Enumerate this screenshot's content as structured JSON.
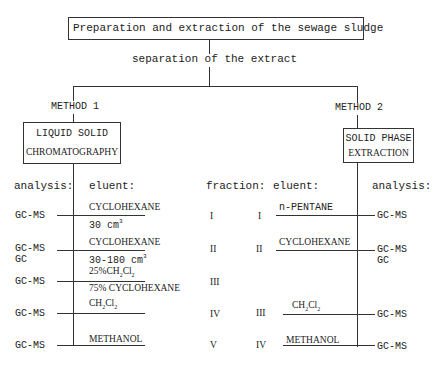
{
  "top": {
    "title": "Preparation and extraction of the sewage sludge",
    "step": "separation of the extract"
  },
  "methods": [
    {
      "label": "METHOD 1",
      "box_line1": "LIQUID SOLID",
      "box_line2": "CHROMATOGRAPHY"
    },
    {
      "label": "METHOD 2",
      "box_line1": "SOLID PHASE",
      "box_line2": "EXTRACTION"
    }
  ],
  "headers": {
    "analysis_left": "analysis:",
    "eluent_left": "eluent:",
    "fraction": "fraction:",
    "eluent_right": "eluent:",
    "analysis_right": "analysis:"
  },
  "method1_rows": [
    {
      "analysis": "GC-MS",
      "analysis2": "",
      "eluent": "CYCLOHEXANE",
      "eluent_detail": "30 cm",
      "detail_sup": "3",
      "fraction": "I"
    },
    {
      "analysis": "GC-MS",
      "analysis2": "GC",
      "eluent": "CYCLOHEXANE",
      "eluent_detail": "30-180 cm",
      "detail_sup": "3",
      "fraction": "II"
    },
    {
      "analysis": "GC-MS",
      "analysis2": "",
      "eluent_top": "25%CH",
      "eluent_sub1": "2",
      "eluent_mid": "Cl",
      "eluent_sub2": "2",
      "eluent": "75% CYCLOHEXANE",
      "fraction": "III"
    },
    {
      "analysis": "GC-MS",
      "analysis2": "",
      "eluent_a": "CH",
      "eluent_sub1": "2",
      "eluent_b": "Cl",
      "eluent_sub2": "2",
      "fraction": "IV"
    },
    {
      "analysis": "GC-MS",
      "analysis2": "",
      "eluent": "METHANOL",
      "fraction": "V"
    }
  ],
  "method2_rows": [
    {
      "fraction": "I",
      "eluent": "n-PENTANE",
      "analysis": "GC-MS",
      "analysis2": ""
    },
    {
      "fraction": "II",
      "eluent": "CYCLOHEXANE",
      "analysis": "GC-MS",
      "analysis2": "GC"
    },
    {
      "fraction": "III",
      "eluent_a": "CH",
      "eluent_sub1": "2",
      "eluent_b": "Cl",
      "eluent_sub2": "2",
      "analysis": "GC-MS",
      "analysis2": ""
    },
    {
      "fraction": "IV",
      "eluent": "METHANOL",
      "analysis": "GC-MS",
      "analysis2": ""
    }
  ]
}
